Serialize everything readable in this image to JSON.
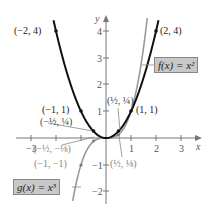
{
  "chart_data": {
    "type": "line",
    "title": "",
    "xlabel": "x",
    "ylabel": "y",
    "xlim": [
      -3.5,
      3.8
    ],
    "ylim": [
      -2.6,
      4.8
    ],
    "x_ticks": [
      "-3",
      "1",
      "2",
      "3"
    ],
    "y_ticks": [
      "-2",
      "-1",
      "1",
      "2",
      "3",
      "4"
    ],
    "grid": false,
    "series": [
      {
        "name": "f(x) = x²",
        "function": "x^2",
        "color": "#111111",
        "domain": [
          -2.1,
          2.1
        ],
        "points": [
          {
            "x": -2,
            "y": 4,
            "label": "(−2, 4)"
          },
          {
            "x": -1,
            "y": 1,
            "label": "(−1, 1)"
          },
          {
            "x": -0.5,
            "y": 0.25,
            "label": "(−½, ¼)"
          },
          {
            "x": 0.5,
            "y": 0.25,
            "label": "(½, ¼)"
          },
          {
            "x": 1,
            "y": 1,
            "label": "(1, 1)"
          },
          {
            "x": 2,
            "y": 4,
            "label": "(2, 4)"
          }
        ]
      },
      {
        "name": "g(x) = x³",
        "function": "x^3",
        "color": "#9a9a9a",
        "domain": [
          -1.33,
          1.65
        ],
        "points": [
          {
            "x": -1,
            "y": -1,
            "label": "(−1, −1)"
          },
          {
            "x": -0.5,
            "y": -0.125,
            "label": "(−½, −⅛)"
          },
          {
            "x": 0.5,
            "y": 0.125,
            "label": "(½, ⅛)"
          }
        ]
      }
    ]
  },
  "labels": {
    "f_box": "f(x) = x²",
    "g_box": "g(x) = x³",
    "x_axis": "x",
    "y_axis": "y",
    "p_m2_4": "(−2, 4)",
    "p_2_4": "(2, 4)",
    "p_m1_1": "(−1, 1)",
    "p_1_1": "(1, 1)",
    "p_mh_q": "(−½, ¼)",
    "p_h_q": "(½, ¼)",
    "p_mh_me": "(−½, −⅛)",
    "p_m1_m1": "(−1, −1)",
    "p_h_e": "(½, ⅛)",
    "tick_m3": "−3",
    "tick_x1": "1",
    "tick_x2": "2",
    "tick_x3": "3",
    "tick_y4": "4",
    "tick_y3": "3",
    "tick_y2": "2",
    "tick_y1": "1",
    "tick_ym1": "−1",
    "tick_ym2": "−2"
  }
}
